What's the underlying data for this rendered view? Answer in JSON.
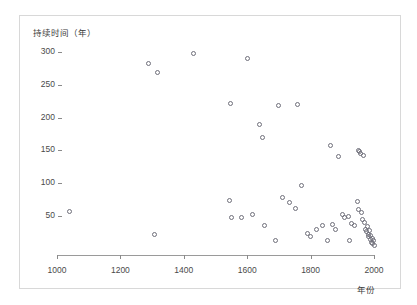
{
  "chart_data": {
    "type": "scatter",
    "title": "",
    "ylabel": "持续时间（年）",
    "xlabel": "年份",
    "xlim": [
      960,
      2020
    ],
    "ylim": [
      0,
      320
    ],
    "xticks": [
      1000,
      1200,
      1400,
      1600,
      1800,
      2000
    ],
    "xtick_labels": [
      "1000",
      "1200",
      "1400",
      "1600",
      "1800",
      "2000"
    ],
    "yticks": [
      50,
      100,
      150,
      200,
      250,
      300
    ],
    "ytick_labels": [
      "50",
      "100",
      "150",
      "200",
      "250",
      "300"
    ],
    "grid": false,
    "legend": null,
    "marker": "open-circle",
    "marker_color": "#6f6f7a",
    "points": [
      {
        "x": 1040,
        "y": 57
      },
      {
        "x": 1290,
        "y": 283
      },
      {
        "x": 1308,
        "y": 22
      },
      {
        "x": 1318,
        "y": 268
      },
      {
        "x": 1432,
        "y": 297
      },
      {
        "x": 1545,
        "y": 74
      },
      {
        "x": 1548,
        "y": 222
      },
      {
        "x": 1552,
        "y": 47
      },
      {
        "x": 1583,
        "y": 47
      },
      {
        "x": 1600,
        "y": 290
      },
      {
        "x": 1618,
        "y": 52
      },
      {
        "x": 1640,
        "y": 190
      },
      {
        "x": 1648,
        "y": 170
      },
      {
        "x": 1655,
        "y": 35
      },
      {
        "x": 1688,
        "y": 12
      },
      {
        "x": 1700,
        "y": 218
      },
      {
        "x": 1712,
        "y": 78
      },
      {
        "x": 1735,
        "y": 70
      },
      {
        "x": 1752,
        "y": 62
      },
      {
        "x": 1760,
        "y": 220
      },
      {
        "x": 1772,
        "y": 97
      },
      {
        "x": 1790,
        "y": 24
      },
      {
        "x": 1800,
        "y": 18
      },
      {
        "x": 1818,
        "y": 30
      },
      {
        "x": 1838,
        "y": 36
      },
      {
        "x": 1852,
        "y": 12
      },
      {
        "x": 1862,
        "y": 158
      },
      {
        "x": 1868,
        "y": 37
      },
      {
        "x": 1878,
        "y": 30
      },
      {
        "x": 1888,
        "y": 140
      },
      {
        "x": 1902,
        "y": 52
      },
      {
        "x": 1908,
        "y": 48
      },
      {
        "x": 1918,
        "y": 50
      },
      {
        "x": 1922,
        "y": 12
      },
      {
        "x": 1928,
        "y": 38
      },
      {
        "x": 1940,
        "y": 36
      },
      {
        "x": 1948,
        "y": 72
      },
      {
        "x": 1950,
        "y": 60
      },
      {
        "x": 1952,
        "y": 150
      },
      {
        "x": 1955,
        "y": 148
      },
      {
        "x": 1958,
        "y": 145
      },
      {
        "x": 1960,
        "y": 55
      },
      {
        "x": 1964,
        "y": 45
      },
      {
        "x": 1968,
        "y": 142
      },
      {
        "x": 1970,
        "y": 40
      },
      {
        "x": 1972,
        "y": 30
      },
      {
        "x": 1976,
        "y": 26
      },
      {
        "x": 1980,
        "y": 34
      },
      {
        "x": 1982,
        "y": 22
      },
      {
        "x": 1984,
        "y": 18
      },
      {
        "x": 1986,
        "y": 28
      },
      {
        "x": 1988,
        "y": 14
      },
      {
        "x": 1990,
        "y": 20
      },
      {
        "x": 1992,
        "y": 10
      },
      {
        "x": 1994,
        "y": 16
      },
      {
        "x": 1996,
        "y": 8
      },
      {
        "x": 1998,
        "y": 12
      },
      {
        "x": 2000,
        "y": 5
      }
    ]
  }
}
